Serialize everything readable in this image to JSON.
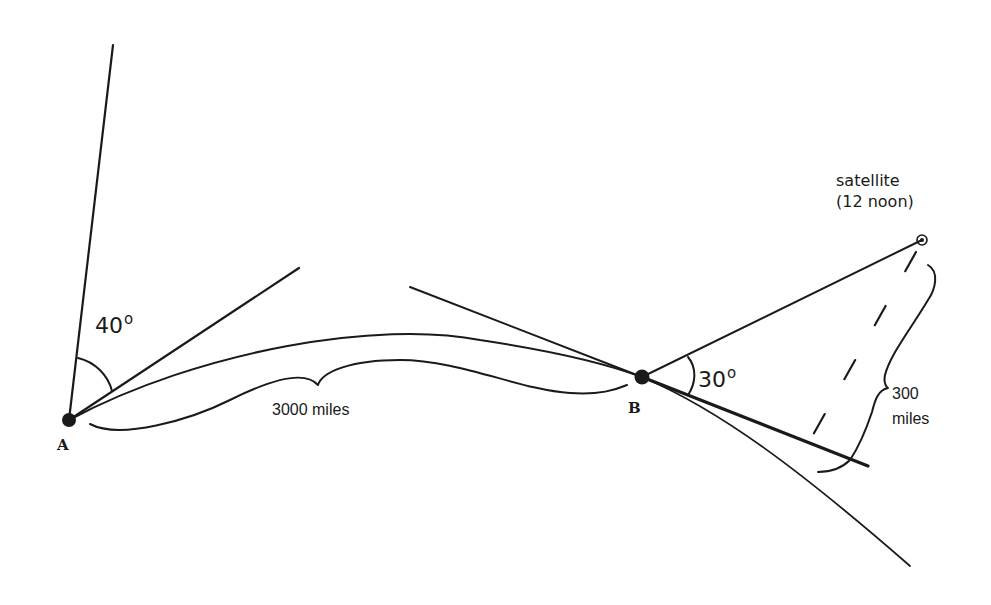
{
  "diagram": {
    "points": {
      "A": {
        "label": "A"
      },
      "B": {
        "label": "B"
      },
      "satellite": {
        "label": "satellite",
        "sublabel": "(12 noon)"
      }
    },
    "angles": {
      "at_A": {
        "value": "40",
        "unit": "o"
      },
      "at_B": {
        "value": "30",
        "unit": "o"
      }
    },
    "distances": {
      "A_to_B": "3000 miles",
      "satellite_height_value": "300",
      "satellite_height_unit": "miles"
    },
    "colors": {
      "ink": "#1a1a1a",
      "background": "#ffffff"
    }
  }
}
